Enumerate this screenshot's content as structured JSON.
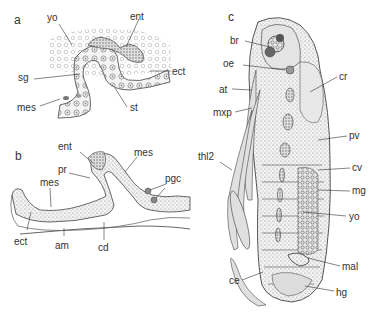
{
  "figure": {
    "panels": [
      {
        "id": "a",
        "labels": [
          "yo",
          "ent",
          "sg",
          "ect",
          "mes",
          "st"
        ]
      },
      {
        "id": "b",
        "labels": [
          "ent",
          "mes",
          "pr",
          "pgc",
          "mes",
          "ect",
          "am",
          "cd"
        ]
      },
      {
        "id": "c",
        "labels": [
          "br",
          "oe",
          "cr",
          "at",
          "mxp",
          "pv",
          "thl2",
          "cv",
          "mg",
          "yo",
          "mal",
          "ce",
          "hg"
        ]
      }
    ]
  }
}
